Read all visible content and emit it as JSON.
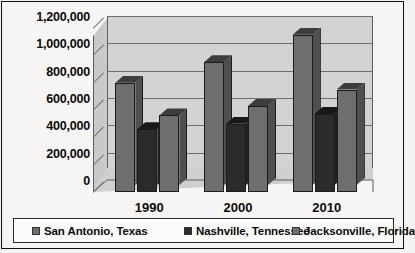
{
  "chart_data": {
    "type": "bar",
    "title": "",
    "subtitle": "",
    "xlabel": "",
    "ylabel": "",
    "categories": [
      "1990",
      "2000",
      "2010"
    ],
    "series": [
      {
        "name": "San Antonio, Texas",
        "values": [
          800000,
          950000,
          1150000
        ],
        "color": "#6e6e6e"
      },
      {
        "name": "Nashville, Tennessee",
        "values": [
          460000,
          500000,
          570000
        ],
        "color": "#2b2b2b"
      },
      {
        "name": "Jacksonville, Florida",
        "values": [
          560000,
          630000,
          750000
        ],
        "color": "#6e6e6e"
      }
    ],
    "ylim": [
      0,
      1200000
    ],
    "ytick_values": [
      0,
      200000,
      400000,
      600000,
      800000,
      1000000,
      1200000
    ],
    "ytick_labels": [
      "0",
      "200,000",
      "400,000",
      "600,000",
      "800,000",
      "1,000,000",
      "1,200,000"
    ],
    "grid": true,
    "legend_position": "bottom",
    "three_d": true,
    "plot_background": "#d3d3d3",
    "figure_background": "#f6f5f3",
    "axis_color": "#5d5d5d",
    "gridline_color": "#6f6f6f"
  },
  "legend": {
    "items": [
      {
        "label": "San Antonio, Texas"
      },
      {
        "label": "Nashville, Tennessee"
      },
      {
        "label": "Jacksonville, Florida"
      }
    ]
  }
}
